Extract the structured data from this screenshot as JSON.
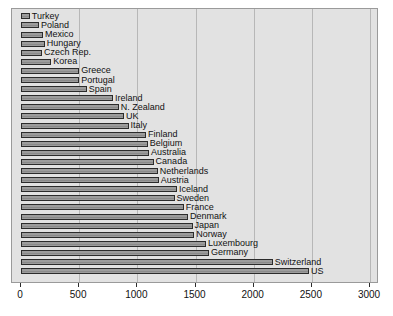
{
  "chart_data": {
    "type": "bar",
    "orientation": "horizontal",
    "title": "",
    "subtitle": "",
    "xlabel": "",
    "ylabel": "",
    "xlim": [
      0,
      3000
    ],
    "ylim": null,
    "grid": true,
    "legend": null,
    "xticks": [
      0,
      500,
      1000,
      1500,
      2000,
      2500,
      3000
    ],
    "xtick_labels": [
      "0",
      "500",
      "1000",
      "1500",
      "2000",
      "2500",
      "3000"
    ],
    "categories": [
      "Turkey",
      "Poland",
      "Mexico",
      "Hungary",
      "Czech Rep.",
      "Korea",
      "Greece",
      "Portugal",
      "Spain",
      "Ireland",
      "N. Zealand",
      "UK",
      "Italy",
      "Finland",
      "Belgium",
      "Australia",
      "Canada",
      "Netherlands",
      "Austria",
      "Iceland",
      "Sweden",
      "France",
      "Denmark",
      "Japan",
      "Norway",
      "Luxembourg",
      "Germany",
      "Switzerland",
      "US"
    ],
    "values": [
      75,
      155,
      190,
      205,
      180,
      260,
      500,
      500,
      565,
      790,
      840,
      885,
      925,
      1075,
      1090,
      1100,
      1140,
      1175,
      1185,
      1340,
      1320,
      1400,
      1435,
      1475,
      1490,
      1590,
      1615,
      2165,
      2475
    ],
    "colors": {
      "bar_fill": "#9c9c9c",
      "bar_edge": "#2b2b2b",
      "plot_background": "#e2e2e2",
      "gridline": "#b7b7b7",
      "frame": "#9a9a9a",
      "text": "#111111",
      "figure_background": "#ffffff"
    }
  }
}
